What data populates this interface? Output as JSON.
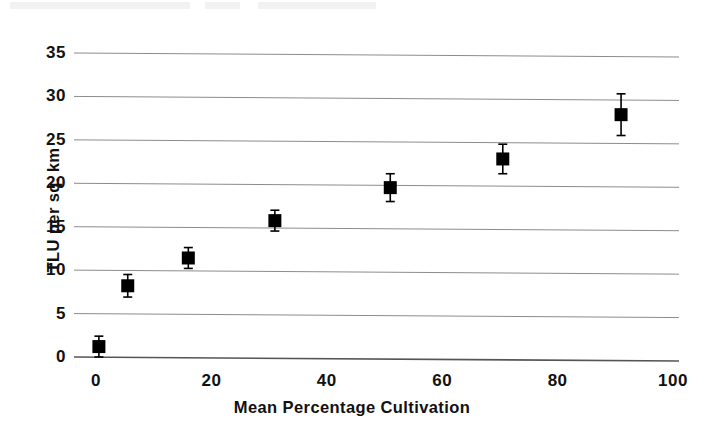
{
  "chart_data": {
    "type": "scatter",
    "title": "",
    "xlabel": "Mean Percentage Cultivation",
    "ylabel": "TLU per sq. km",
    "xlim": [
      0,
      100
    ],
    "ylim": [
      0,
      35
    ],
    "xticks": [
      0,
      20,
      40,
      60,
      80,
      100
    ],
    "yticks": [
      0,
      5,
      10,
      15,
      20,
      25,
      30,
      35
    ],
    "grid": "horizontal",
    "legend": "none",
    "marker": "filled-square",
    "error_bars": "vertical",
    "series": [
      {
        "name": "TLU per sq. km",
        "points": [
          {
            "x": 0.5,
            "y": 1.2,
            "yerr": 1.2
          },
          {
            "x": 5.5,
            "y": 8.2,
            "yerr": 1.3
          },
          {
            "x": 16.0,
            "y": 11.4,
            "yerr": 1.2
          },
          {
            "x": 31.0,
            "y": 15.7,
            "yerr": 1.2
          },
          {
            "x": 51.0,
            "y": 19.5,
            "yerr": 1.6
          },
          {
            "x": 70.5,
            "y": 22.8,
            "yerr": 1.7
          },
          {
            "x": 91.0,
            "y": 27.9,
            "yerr": 2.4
          }
        ]
      }
    ],
    "colors": {
      "marker": "#000000",
      "gridline": "#8c8c8c",
      "axis": "#555555",
      "text": "#111111",
      "background": "#ffffff"
    }
  }
}
